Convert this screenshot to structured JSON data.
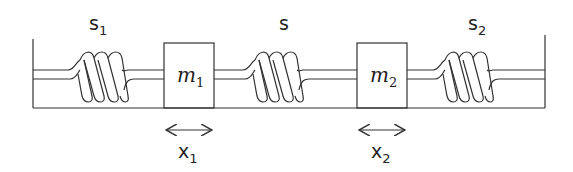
{
  "diagram": {
    "springs": [
      {
        "id": "s1",
        "label": "s",
        "sub": "1"
      },
      {
        "id": "s",
        "label": "s",
        "sub": ""
      },
      {
        "id": "s2",
        "label": "s",
        "sub": "2"
      }
    ],
    "masses": [
      {
        "id": "m1",
        "label": "m",
        "sub": "1"
      },
      {
        "id": "m2",
        "label": "m",
        "sub": "2"
      }
    ],
    "displacements": [
      {
        "id": "x1",
        "label": "x",
        "sub": "1"
      },
      {
        "id": "x2",
        "label": "x",
        "sub": "2"
      }
    ],
    "colors": {
      "stroke": "#333333",
      "background": "#ffffff"
    }
  }
}
